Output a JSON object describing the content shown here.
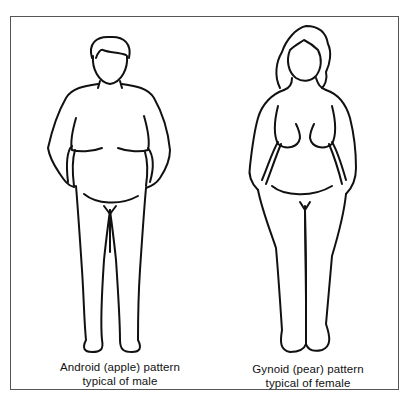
{
  "figure": {
    "type": "body-fat-distribution-illustration",
    "border_color": "#555555",
    "line_color": "#111111",
    "panels": [
      {
        "id": "male",
        "icon": "male-body-outline-icon",
        "caption_line1": "Android (apple) pattern",
        "caption_line2": "typical of male"
      },
      {
        "id": "female",
        "icon": "female-body-outline-icon",
        "caption_line1": "Gynoid (pear) pattern",
        "caption_line2": "typical of female"
      }
    ]
  }
}
